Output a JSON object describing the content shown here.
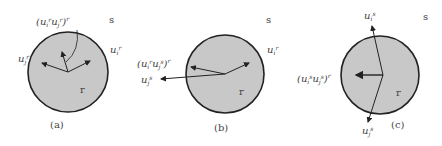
{
  "diagram": {
    "colors": {
      "circle_fill": "#c8c8c8",
      "circle_stroke": "#222222",
      "arrow": "#222222",
      "text": "#444444"
    },
    "panels": [
      {
        "id": "a",
        "caption": "(a)",
        "outer_region": "s",
        "inner_region": "r",
        "correlation_label": {
          "base1": "u",
          "sub1": "i",
          "sup1": "r",
          "base2": "u",
          "sub2": "j",
          "sup2": "r",
          "outer_sup": "r"
        },
        "vector_labels": [
          {
            "base": "u",
            "sub": "j",
            "sup": "r",
            "side": "left"
          },
          {
            "base": "u",
            "sub": "i",
            "sup": "r",
            "side": "right"
          }
        ]
      },
      {
        "id": "b",
        "caption": "(b)",
        "outer_region": "s",
        "inner_region": "r",
        "correlation_label": {
          "base1": "u",
          "sub1": "i",
          "sup1": "r",
          "base2": "u",
          "sub2": "j",
          "sup2": "s",
          "outer_sup": "r"
        },
        "vector_labels": [
          {
            "base": "u",
            "sub": "j",
            "sup": "s",
            "side": "left"
          },
          {
            "base": "u",
            "sub": "i",
            "sup": "r",
            "side": "right"
          }
        ]
      },
      {
        "id": "c",
        "caption": "(c)",
        "outer_region": "s",
        "inner_region": "r",
        "correlation_label": {
          "base1": "u",
          "sub1": "i",
          "sup1": "s",
          "base2": "u",
          "sub2": "j",
          "sup2": "s",
          "outer_sup": "r"
        },
        "vector_labels": [
          {
            "base": "u",
            "sub": "i",
            "sup": "s",
            "side": "top"
          },
          {
            "base": "u",
            "sub": "j",
            "sup": "s",
            "side": "bottom"
          }
        ]
      }
    ]
  }
}
